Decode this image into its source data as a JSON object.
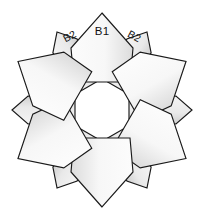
{
  "figure": {
    "background_color": "#ffffff",
    "width": 204,
    "height": 211
  },
  "style": {
    "outline_color": "#1a1a1a",
    "large_petal_fill_light": "#fdfdfd",
    "large_petal_fill_dark": "#e3e3e3",
    "sliver_petal_fill_light": "#f2f2f2",
    "sliver_petal_fill_dark": "#d2d2d2",
    "label_color": "#111111"
  },
  "center": {
    "hole_label": "",
    "cx": 102,
    "cy": 110,
    "radius": 25
  },
  "labels": [
    {
      "id": "label-b1",
      "text": "B1",
      "x": 102,
      "y": 32,
      "rotation": 0,
      "size": "large"
    },
    {
      "id": "label-b2-left",
      "text": "B2",
      "x": 70,
      "y": 37,
      "rotation": -28,
      "size": "small"
    },
    {
      "id": "label-b2-right",
      "text": "B2",
      "x": 134,
      "y": 37,
      "rotation": 28,
      "size": "small"
    }
  ],
  "petals": [
    {
      "id": "petal-large-1",
      "kind": "large",
      "angle": 0,
      "name": "top-large-petal"
    },
    {
      "id": "petal-large-2",
      "kind": "large",
      "angle": 60,
      "name": "upper-right-large-petal"
    },
    {
      "id": "petal-large-3",
      "kind": "large",
      "angle": 120,
      "name": "lower-right-large-petal"
    },
    {
      "id": "petal-large-4",
      "kind": "large",
      "angle": 180,
      "name": "bottom-large-petal"
    },
    {
      "id": "petal-large-5",
      "kind": "large",
      "angle": 240,
      "name": "lower-left-large-petal"
    },
    {
      "id": "petal-large-6",
      "kind": "large",
      "angle": 300,
      "name": "upper-left-large-petal"
    },
    {
      "id": "petal-sliver-1",
      "kind": "sliver",
      "angle": 30,
      "name": "sliver-petal-upper-right"
    },
    {
      "id": "petal-sliver-2",
      "kind": "sliver",
      "angle": 90,
      "name": "sliver-petal-right"
    },
    {
      "id": "petal-sliver-3",
      "kind": "sliver",
      "angle": 150,
      "name": "sliver-petal-lower-right"
    },
    {
      "id": "petal-sliver-4",
      "kind": "sliver",
      "angle": 210,
      "name": "sliver-petal-lower-left"
    },
    {
      "id": "petal-sliver-5",
      "kind": "sliver",
      "angle": 270,
      "name": "sliver-petal-left"
    },
    {
      "id": "petal-sliver-6",
      "kind": "sliver",
      "angle": 330,
      "name": "sliver-petal-upper-left"
    }
  ],
  "geometry": {
    "large_petal_path": "M 0,-97 L 31,-62 L 28,-28 L -28,-28 L -31,-62 Z",
    "sliver_petal_path": "M 0,-90 L 14,-74 L 9,-27 L -9,-27 L -14,-74 Z"
  }
}
